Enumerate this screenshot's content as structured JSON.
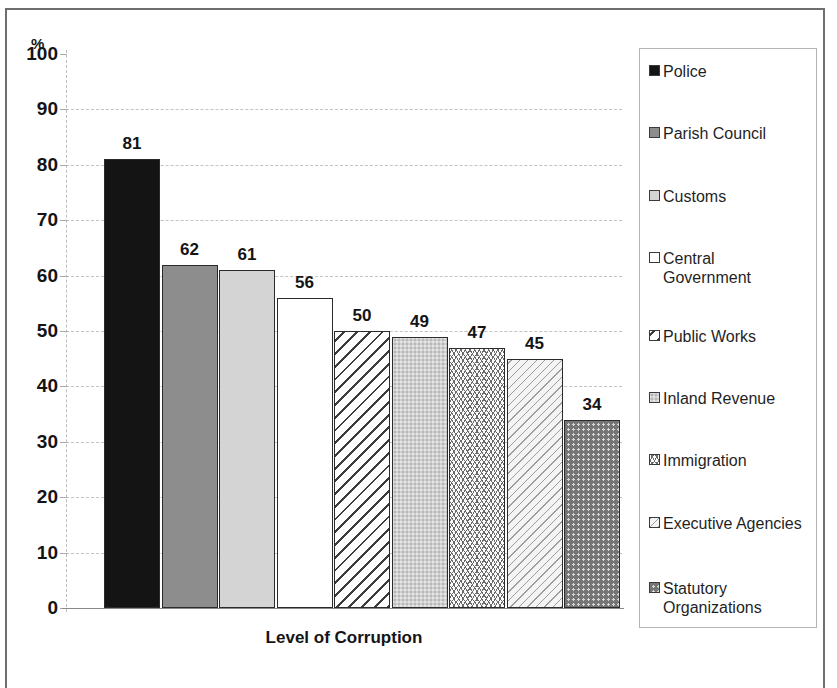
{
  "chart_data": {
    "type": "bar",
    "title": "",
    "subtitle": "",
    "xlabel": "Level of Corruption",
    "ylabel": "%",
    "ylim": [
      0,
      100
    ],
    "ytick_labels": [
      "100",
      "90",
      "80",
      "70",
      "60",
      "50",
      "40",
      "30",
      "20",
      "10",
      "0"
    ],
    "ytick_values": [
      100,
      90,
      80,
      70,
      60,
      50,
      40,
      30,
      20,
      10,
      0
    ],
    "grid": true,
    "grid_axis": "y",
    "legend_position": "right",
    "categories": [
      "Police",
      "Parish Council",
      "Customs",
      "Central Government",
      "Public Works",
      "Inland Revenue",
      "Immigration",
      "Executive Agencies",
      "Statutory Organizations"
    ],
    "values": [
      81,
      62,
      61,
      56,
      50,
      49,
      47,
      45,
      34
    ],
    "value_labels": [
      "81",
      "62",
      "61",
      "56",
      "50",
      "49",
      "47",
      "45",
      "34"
    ],
    "bar_fills": [
      "solid-black",
      "gray-medium",
      "gray-light",
      "white",
      "diagonal-hatch-wide",
      "speckle-light-gray",
      "wavy-lines",
      "diagonal-hatch-fine",
      "dark-gray-dots"
    ]
  },
  "axis": {
    "percent_symbol": "%",
    "xaxis_title": "Level of Corruption"
  },
  "legend": {
    "items": [
      {
        "label": "Police",
        "fill": "solid-black"
      },
      {
        "label": "Parish Council",
        "fill": "gray-medium"
      },
      {
        "label": "Customs",
        "fill": "gray-light"
      },
      {
        "label": "Central\nGovernment",
        "fill": "white"
      },
      {
        "label": "Public Works",
        "fill": "diagonal-hatch-wide"
      },
      {
        "label": "Inland Revenue",
        "fill": "speckle-light-gray"
      },
      {
        "label": "Immigration",
        "fill": "wavy-lines"
      },
      {
        "label": "Executive Agencies",
        "fill": "diagonal-hatch-fine"
      },
      {
        "label": "Statutory\nOrganizations",
        "fill": "dark-gray-dots"
      }
    ]
  },
  "colors": {
    "solid_black": "#141414",
    "gray_medium": "#8d8d8d",
    "gray_light": "#d4d4d4",
    "white": "#ffffff",
    "dark_gray": "#757575",
    "gridline": "#c2c2c2",
    "frame": "#6e6e6e"
  }
}
